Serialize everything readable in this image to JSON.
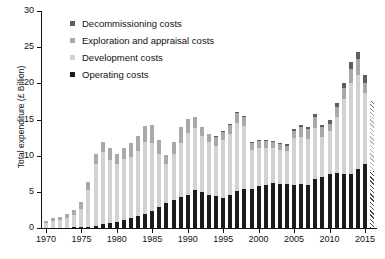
{
  "chart_data": {
    "type": "bar",
    "title": "",
    "xlabel": "",
    "ylabel": "Total expenditure (£ Billion)",
    "ylim": [
      0,
      30
    ],
    "yticks": [
      0,
      5,
      10,
      15,
      20,
      25,
      30
    ],
    "xticks": [
      1970,
      1975,
      1980,
      1985,
      1990,
      1995,
      2000,
      2005,
      2010,
      2015
    ],
    "xlim": [
      1969.3,
      2016.7
    ],
    "grid": false,
    "stacked": true,
    "legend_position": "top-left",
    "categories": [
      1970,
      1971,
      1972,
      1973,
      1974,
      1975,
      1976,
      1977,
      1978,
      1979,
      1980,
      1981,
      1982,
      1983,
      1984,
      1985,
      1986,
      1987,
      1988,
      1989,
      1990,
      1991,
      1992,
      1993,
      1994,
      1995,
      1996,
      1997,
      1998,
      1999,
      2000,
      2001,
      2002,
      2003,
      2004,
      2005,
      2006,
      2007,
      2008,
      2009,
      2010,
      2011,
      2012,
      2013,
      2014,
      2015,
      2016
    ],
    "series": [
      {
        "name": "Operating costs",
        "color": "#1c1c1c",
        "values": [
          0.05,
          0.05,
          0.05,
          0.05,
          0.1,
          0.1,
          0.2,
          0.3,
          0.5,
          0.7,
          0.9,
          1.1,
          1.4,
          1.7,
          2.0,
          2.4,
          2.9,
          3.4,
          3.9,
          4.3,
          4.6,
          5.2,
          5.0,
          4.6,
          4.4,
          4.2,
          4.6,
          5.1,
          5.4,
          5.4,
          5.8,
          6.0,
          6.2,
          6.1,
          6.1,
          6.0,
          6.1,
          6.0,
          6.8,
          7.0,
          7.4,
          7.6,
          7.5,
          7.4,
          8.1,
          8.9,
          7.9
        ]
      },
      {
        "name": "Development costs",
        "color": "#d2d2d2",
        "values": [
          0.6,
          0.9,
          1.0,
          1.3,
          1.7,
          2.5,
          5.0,
          8.5,
          10.0,
          8.7,
          7.9,
          8.4,
          8.4,
          9.0,
          9.9,
          9.4,
          7.4,
          5.4,
          6.4,
          7.4,
          8.6,
          8.6,
          7.7,
          7.3,
          7.0,
          7.9,
          8.4,
          9.4,
          8.7,
          5.4,
          5.2,
          5.1,
          4.8,
          4.7,
          4.6,
          6.4,
          6.5,
          6.3,
          7.0,
          5.6,
          6.0,
          7.7,
          10.3,
          12.6,
          13.0,
          9.7,
          7.4
        ]
      },
      {
        "name": "Exploration and appraisal costs",
        "color": "#a9a9a9",
        "values": [
          0.3,
          0.4,
          0.5,
          0.6,
          0.7,
          1.0,
          1.2,
          1.5,
          1.4,
          1.6,
          1.5,
          1.6,
          1.9,
          2.0,
          2.2,
          2.4,
          1.8,
          1.3,
          1.6,
          2.2,
          1.9,
          1.5,
          1.3,
          1.1,
          1.2,
          1.2,
          1.3,
          1.4,
          1.3,
          0.9,
          1.0,
          0.9,
          0.9,
          0.8,
          0.7,
          1.0,
          1.3,
          1.4,
          1.5,
          1.3,
          1.0,
          1.4,
          1.6,
          2.0,
          2.2,
          1.5,
          1.1
        ]
      },
      {
        "name": "Decommissioning costs",
        "color": "#5e5e5e",
        "values": [
          0,
          0,
          0,
          0,
          0,
          0,
          0,
          0,
          0,
          0,
          0,
          0,
          0,
          0,
          0,
          0,
          0,
          0,
          0,
          0,
          0,
          0,
          0,
          0,
          0.1,
          0.1,
          0.1,
          0.1,
          0.1,
          0.2,
          0.2,
          0.2,
          0.2,
          0.2,
          0.2,
          0.3,
          0.3,
          0.3,
          0.4,
          0.4,
          0.5,
          0.6,
          0.7,
          0.9,
          1.0,
          1.0,
          1.1
        ]
      }
    ],
    "totals": [
      0.95,
      1.35,
      1.55,
      1.95,
      2.5,
      3.6,
      6.4,
      10.3,
      11.9,
      11.0,
      10.3,
      11.1,
      11.7,
      12.7,
      14.1,
      14.2,
      12.1,
      10.1,
      11.9,
      13.9,
      15.1,
      15.3,
      14.0,
      13.0,
      12.7,
      13.4,
      14.4,
      16.0,
      15.5,
      11.9,
      12.2,
      12.2,
      12.1,
      11.8,
      11.6,
      13.7,
      14.2,
      14.0,
      15.7,
      14.3,
      14.9,
      17.3,
      20.1,
      22.9,
      24.3,
      21.1,
      17.5
    ],
    "forecast_years": [
      2016
    ]
  },
  "legend": {
    "items": [
      {
        "label": "Decommissioning costs",
        "color": "#5e5e5e"
      },
      {
        "label": "Exploration and appraisal costs",
        "color": "#a9a9a9"
      },
      {
        "label": "Development costs",
        "color": "#d2d2d2"
      },
      {
        "label": "Operating costs",
        "color": "#1c1c1c"
      }
    ]
  },
  "axes": {
    "y_title": "Total expenditure (£ Billion)",
    "y_tick_labels": [
      "0",
      "5",
      "10",
      "15",
      "20",
      "25",
      "30"
    ],
    "x_tick_labels": [
      "1970",
      "1975",
      "1980",
      "1985",
      "1990",
      "1995",
      "2000",
      "2005",
      "2010",
      "2015"
    ]
  }
}
